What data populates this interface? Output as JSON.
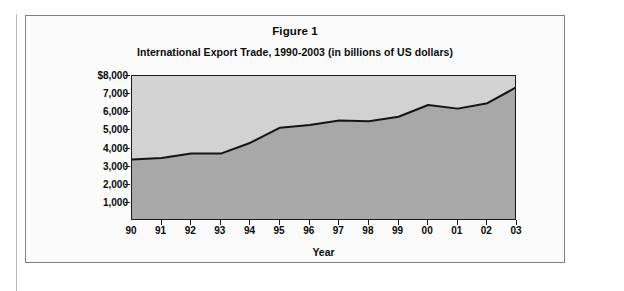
{
  "figure": {
    "title": "Figure 1",
    "subtitle": "International Export Trade, 1990-2003 (in billions of US dollars)"
  },
  "colors": {
    "plot_background": "#d2d2d2",
    "area_fill": "#a8a8a8",
    "line": "#141414",
    "axis": "#1a1a1a",
    "figure_border": "#808080",
    "page_background": "#ffffff"
  },
  "chart_data": {
    "type": "area",
    "title": "Figure 1",
    "subtitle": "International Export Trade, 1990-2003 (in billions of US dollars)",
    "xlabel": "Year",
    "ylabel": "",
    "x": [
      "90",
      "91",
      "92",
      "93",
      "94",
      "95",
      "96",
      "97",
      "98",
      "99",
      "00",
      "01",
      "02",
      "03"
    ],
    "categories": [
      "90",
      "91",
      "92",
      "93",
      "94",
      "95",
      "96",
      "97",
      "98",
      "99",
      "00",
      "01",
      "02",
      "03"
    ],
    "values": [
      3400,
      3480,
      3720,
      3720,
      4320,
      5150,
      5300,
      5550,
      5500,
      5750,
      6400,
      6200,
      6500,
      7400
    ],
    "series": [
      {
        "name": "International Export Trade",
        "values": [
          3400,
          3480,
          3720,
          3720,
          4320,
          5150,
          5300,
          5550,
          5500,
          5750,
          6400,
          6200,
          6500,
          7400
        ]
      }
    ],
    "ylim": [
      0,
      8000
    ],
    "ytick_values": [
      8000,
      7000,
      6000,
      5000,
      4000,
      3000,
      2000,
      1000
    ],
    "ytick_labels": [
      "$8,000",
      "7,000",
      "6,000",
      "5,000",
      "4,000",
      "3,000",
      "2,000",
      "1,000"
    ],
    "xtick_labels": [
      "90",
      "91",
      "92",
      "93",
      "94",
      "95",
      "96",
      "97",
      "98",
      "99",
      "00",
      "01",
      "02",
      "03"
    ],
    "grid": false,
    "legend": "none",
    "units": "billions of US dollars"
  }
}
